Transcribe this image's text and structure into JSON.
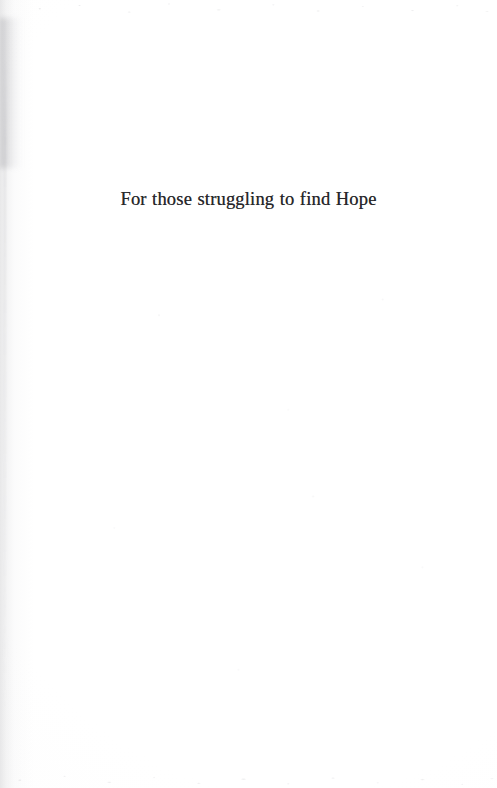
{
  "page": {
    "kind": "book-dedication-page",
    "background_color": "#fefefe",
    "width": 497,
    "height": 788
  },
  "dedication": {
    "text": "For those struggling to find Hope",
    "text_color": "#26262a",
    "alignment": "center"
  },
  "scan_artifacts": {
    "gutter_shadow_edge": "left",
    "gutter_shadow_color": "#8c8c92",
    "speckle_bands": [
      "top",
      "bottom"
    ],
    "speckle_color": "#9a9aa0"
  }
}
